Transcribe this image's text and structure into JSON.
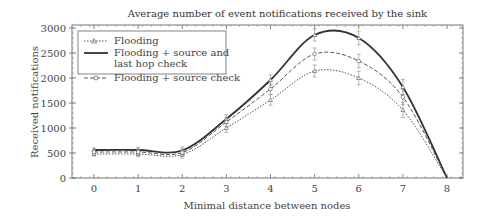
{
  "chart_data": {
    "type": "line",
    "title": "Average number of event notifications received by the sink",
    "xlabel": "Minimal distance between nodes",
    "ylabel": "Received notifications",
    "x": [
      0,
      1,
      2,
      3,
      4,
      5,
      6,
      7,
      8
    ],
    "xlim": [
      -0.5,
      8.5
    ],
    "ylim": [
      0,
      3000
    ],
    "xticks": [
      0,
      1,
      2,
      3,
      4,
      5,
      6,
      7,
      8
    ],
    "yticks": [
      0,
      500,
      1000,
      1500,
      2000,
      2500,
      3000
    ],
    "grid": false,
    "legend_position": "upper left",
    "series": [
      {
        "name": "Flooding",
        "style": "dotted",
        "marker": "triangle",
        "values": [
          480,
          480,
          470,
          1000,
          1560,
          2140,
          2000,
          1360,
          0
        ]
      },
      {
        "name": "Flooding + source and last hop check",
        "style": "solid",
        "marker": "triangle",
        "values": [
          560,
          560,
          550,
          1180,
          1960,
          2860,
          2800,
          1820,
          0
        ]
      },
      {
        "name": "Flooding + source check",
        "style": "dashed",
        "marker": "circle",
        "values": [
          520,
          520,
          510,
          1120,
          1780,
          2480,
          2340,
          1620,
          0
        ]
      }
    ]
  },
  "legend": {
    "item1": "Flooding",
    "item2_line1": "Flooding + source and",
    "item2_line2": "last hop check",
    "item3": "Flooding + source check"
  }
}
